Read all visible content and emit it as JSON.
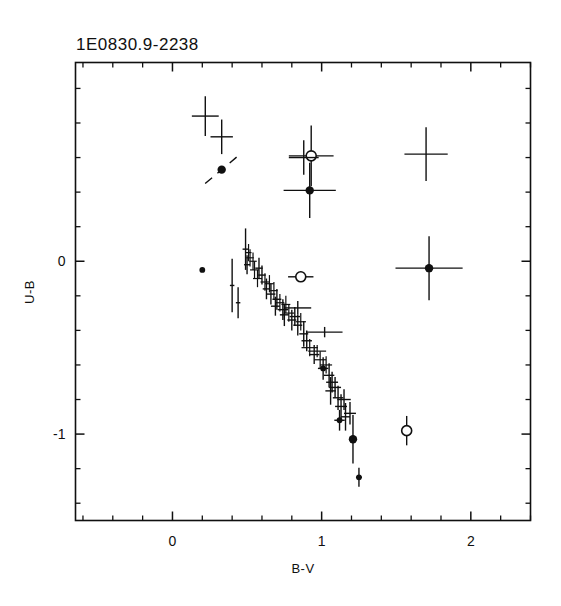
{
  "figure": {
    "title": "1E0830.9-2238",
    "background_color": "#ffffff",
    "ink_color": "#101010"
  },
  "chart_data": {
    "type": "scatter",
    "title": "1E0830.9-2238",
    "xlabel": "B-V",
    "ylabel": "U-B",
    "xlim": [
      -0.65,
      2.4
    ],
    "ylim": [
      -1.5,
      1.15
    ],
    "y_inverted": false,
    "grid": false,
    "legend": null,
    "x_ticks_major": [
      0,
      1,
      2
    ],
    "x_tick_labels": [
      "0",
      "1",
      "2"
    ],
    "x_ticks_minor_step": 0.2,
    "y_ticks_major": [
      0,
      -1
    ],
    "y_tick_labels": [
      "0",
      "-1"
    ],
    "y_ticks_minor_step": 0.2,
    "marker_styles": [
      "cross-errorbar",
      "filled-circle",
      "open-circle"
    ],
    "points": [
      {
        "x": 0.22,
        "y": 0.84,
        "xerr": 0.09,
        "yerr": 0.115,
        "marker": "none"
      },
      {
        "x": 0.33,
        "y": 0.72,
        "xerr": 0.075,
        "yerr": 0.1,
        "marker": "none"
      },
      {
        "x": 0.33,
        "y": 0.53,
        "xerr": 0.085,
        "yerr": 0.095,
        "marker": "filled-circle",
        "tilted": true
      },
      {
        "x": 0.2,
        "y": -0.05,
        "xerr": 0.0,
        "yerr": 0.0,
        "marker": "filled-circle"
      },
      {
        "x": 0.49,
        "y": 0.07,
        "xerr": 0.02,
        "yerr": 0.12,
        "marker": "none"
      },
      {
        "x": 0.51,
        "y": 0.05,
        "xerr": 0.02,
        "yerr": 0.05,
        "marker": "none"
      },
      {
        "x": 0.52,
        "y": 0.02,
        "xerr": 0.025,
        "yerr": 0.05,
        "marker": "none"
      },
      {
        "x": 0.5,
        "y": -0.02,
        "xerr": 0.02,
        "yerr": 0.055,
        "marker": "none"
      },
      {
        "x": 0.54,
        "y": 0.0,
        "xerr": 0.025,
        "yerr": 0.05,
        "marker": "none"
      },
      {
        "x": 0.55,
        "y": -0.05,
        "xerr": 0.03,
        "yerr": 0.05,
        "marker": "none"
      },
      {
        "x": 0.58,
        "y": -0.04,
        "xerr": 0.025,
        "yerr": 0.06,
        "marker": "none"
      },
      {
        "x": 0.57,
        "y": -0.1,
        "xerr": 0.03,
        "yerr": 0.05,
        "marker": "none"
      },
      {
        "x": 0.6,
        "y": -0.08,
        "xerr": 0.025,
        "yerr": 0.055,
        "marker": "none"
      },
      {
        "x": 0.62,
        "y": -0.12,
        "xerr": 0.03,
        "yerr": 0.05,
        "marker": "none"
      },
      {
        "x": 0.63,
        "y": -0.16,
        "xerr": 0.025,
        "yerr": 0.06,
        "marker": "none"
      },
      {
        "x": 0.65,
        "y": -0.13,
        "xerr": 0.03,
        "yerr": 0.05,
        "marker": "none"
      },
      {
        "x": 0.66,
        "y": -0.19,
        "xerr": 0.03,
        "yerr": 0.06,
        "marker": "none"
      },
      {
        "x": 0.68,
        "y": -0.17,
        "xerr": 0.025,
        "yerr": 0.05,
        "marker": "none"
      },
      {
        "x": 0.7,
        "y": -0.22,
        "xerr": 0.03,
        "yerr": 0.06,
        "marker": "none"
      },
      {
        "x": 0.69,
        "y": -0.26,
        "xerr": 0.03,
        "yerr": 0.055,
        "marker": "none"
      },
      {
        "x": 0.72,
        "y": -0.24,
        "xerr": 0.03,
        "yerr": 0.05,
        "marker": "none"
      },
      {
        "x": 0.74,
        "y": -0.28,
        "xerr": 0.035,
        "yerr": 0.06,
        "marker": "none"
      },
      {
        "x": 0.76,
        "y": -0.25,
        "xerr": 0.03,
        "yerr": 0.05,
        "marker": "none"
      },
      {
        "x": 0.75,
        "y": -0.31,
        "xerr": 0.03,
        "yerr": 0.065,
        "marker": "none"
      },
      {
        "x": 0.78,
        "y": -0.3,
        "xerr": 0.035,
        "yerr": 0.05,
        "marker": "none"
      },
      {
        "x": 0.8,
        "y": -0.34,
        "xerr": 0.03,
        "yerr": 0.06,
        "marker": "none"
      },
      {
        "x": 0.82,
        "y": -0.32,
        "xerr": 0.035,
        "yerr": 0.055,
        "marker": "none"
      },
      {
        "x": 0.84,
        "y": -0.37,
        "xerr": 0.03,
        "yerr": 0.06,
        "marker": "none"
      },
      {
        "x": 0.86,
        "y": -0.35,
        "xerr": 0.035,
        "yerr": 0.05,
        "marker": "none"
      },
      {
        "x": 0.4,
        "y": -0.14,
        "xerr": 0.015,
        "yerr": 0.155,
        "marker": "none"
      },
      {
        "x": 0.44,
        "y": -0.24,
        "xerr": 0.015,
        "yerr": 0.09,
        "marker": "none"
      },
      {
        "x": 0.86,
        "y": -0.09,
        "xerr": 0.085,
        "yerr": 0.03,
        "marker": "open-circle"
      },
      {
        "x": 0.84,
        "y": -0.27,
        "xerr": 0.09,
        "yerr": 0.04,
        "marker": "none"
      },
      {
        "x": 0.88,
        "y": -0.42,
        "xerr": 0.03,
        "yerr": 0.075,
        "marker": "none"
      },
      {
        "x": 0.9,
        "y": -0.46,
        "xerr": 0.035,
        "yerr": 0.06,
        "marker": "none"
      },
      {
        "x": 0.92,
        "y": -0.5,
        "xerr": 0.055,
        "yerr": 0.05,
        "marker": "none"
      },
      {
        "x": 0.95,
        "y": -0.54,
        "xerr": 0.035,
        "yerr": 0.055,
        "marker": "none"
      },
      {
        "x": 0.97,
        "y": -0.52,
        "xerr": 0.06,
        "yerr": 0.035,
        "marker": "none"
      },
      {
        "x": 0.99,
        "y": -0.57,
        "xerr": 0.04,
        "yerr": 0.05,
        "marker": "none"
      },
      {
        "x": 1.01,
        "y": -0.62,
        "xerr": 0.035,
        "yerr": 0.065,
        "marker": "filled-circle"
      },
      {
        "x": 1.03,
        "y": -0.6,
        "xerr": 0.04,
        "yerr": 0.05,
        "marker": "none"
      },
      {
        "x": 1.05,
        "y": -0.66,
        "xerr": 0.035,
        "yerr": 0.07,
        "marker": "none"
      },
      {
        "x": 1.07,
        "y": -0.7,
        "xerr": 0.04,
        "yerr": 0.06,
        "marker": "none"
      },
      {
        "x": 1.06,
        "y": -0.75,
        "xerr": 0.035,
        "yerr": 0.08,
        "marker": "none"
      },
      {
        "x": 1.09,
        "y": -0.73,
        "xerr": 0.04,
        "yerr": 0.06,
        "marker": "none"
      },
      {
        "x": 1.11,
        "y": -0.79,
        "xerr": 0.035,
        "yerr": 0.07,
        "marker": "none"
      },
      {
        "x": 1.13,
        "y": -0.84,
        "xerr": 0.04,
        "yerr": 0.07,
        "marker": "none"
      },
      {
        "x": 1.15,
        "y": -0.8,
        "xerr": 0.045,
        "yerr": 0.06,
        "marker": "none"
      },
      {
        "x": 1.16,
        "y": -0.9,
        "xerr": 0.03,
        "yerr": 0.08,
        "marker": "none"
      },
      {
        "x": 1.19,
        "y": -0.88,
        "xerr": 0.04,
        "yerr": 0.065,
        "marker": "none"
      },
      {
        "x": 1.12,
        "y": -0.92,
        "xerr": 0.035,
        "yerr": 0.06,
        "marker": "filled-circle"
      },
      {
        "x": 1.21,
        "y": -1.03,
        "xerr": 0.015,
        "yerr": 0.14,
        "marker": "filled-circle"
      },
      {
        "x": 1.25,
        "y": -1.25,
        "xerr": 0.02,
        "yerr": 0.055,
        "marker": "filled-circle"
      },
      {
        "x": 1.57,
        "y": -0.98,
        "xerr": 0.025,
        "yerr": 0.085,
        "marker": "open-circle"
      },
      {
        "x": 0.93,
        "y": 0.61,
        "xerr": 0.15,
        "yerr": 0.175,
        "marker": "open-circle"
      },
      {
        "x": 0.92,
        "y": 0.41,
        "xerr": 0.175,
        "yerr": 0.16,
        "marker": "filled-circle"
      },
      {
        "x": 1.7,
        "y": 0.62,
        "xerr": 0.145,
        "yerr": 0.155,
        "marker": "none"
      },
      {
        "x": 1.72,
        "y": -0.04,
        "xerr": 0.225,
        "yerr": 0.185,
        "marker": "filled-circle"
      },
      {
        "x": 0.88,
        "y": 0.6,
        "xerr": 0.1,
        "yerr": 0.1,
        "marker": "none"
      },
      {
        "x": 1.02,
        "y": -0.41,
        "xerr": 0.12,
        "yerr": 0.03,
        "marker": "none"
      }
    ]
  },
  "axes": {
    "x_label": "B-V",
    "y_label": "U-B"
  }
}
